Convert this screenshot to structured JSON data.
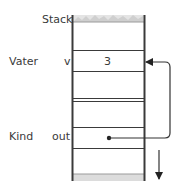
{
  "diagram": {
    "stack_label": "Stack",
    "frames": [
      {
        "name": "Vater",
        "variable": "v",
        "value": "3"
      },
      {
        "name": "Kind",
        "variable": "out",
        "value": ""
      }
    ],
    "pointer": {
      "from": "Kind.out",
      "to": "Vater.v"
    },
    "growth_direction": "down",
    "colors": {
      "line": "#3a3a3a",
      "texture": "#c8c8c8",
      "background": "#ffffff"
    }
  }
}
